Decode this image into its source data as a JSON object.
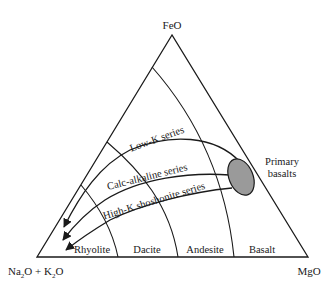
{
  "diagram": {
    "type": "ternary-AFM",
    "vertices": {
      "top": "FeO",
      "left": "Na2O + K2O",
      "left_parts": {
        "a": "Na",
        "a_sub": "2",
        "b": "O + K",
        "b_sub": "2",
        "c": "O"
      },
      "right": "MgO"
    },
    "rock_fields": [
      {
        "label": "Rhyolite"
      },
      {
        "label": "Dacite"
      },
      {
        "label": "Andesite"
      },
      {
        "label": "Basalt"
      }
    ],
    "series": [
      {
        "label": "Low-K series"
      },
      {
        "label": "Calc-alkaline series"
      },
      {
        "label": "High-K shoshonite series"
      }
    ],
    "source_region": {
      "label_line1": "Primary",
      "label_line2": "basalts",
      "fill": "#9a9a9a"
    },
    "colors": {
      "line": "#1a1a1a",
      "background": "#ffffff"
    }
  }
}
